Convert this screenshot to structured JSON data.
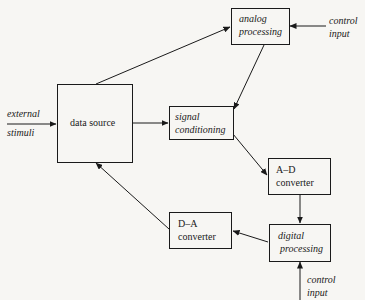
{
  "diagram": {
    "type": "block-diagram",
    "nodes": {
      "data_source": {
        "label": "data source"
      },
      "analog_processing": {
        "line1": "analog",
        "line2": "processing"
      },
      "signal_conditioning": {
        "line1": "signal",
        "line2": "conditioning"
      },
      "ad_converter": {
        "line1": "A–D",
        "line2": "converter"
      },
      "digital_processing": {
        "line1": "digital",
        "line2": "processing"
      },
      "da_converter": {
        "line1": "D–A",
        "line2": "converter"
      }
    },
    "external_inputs": {
      "stimuli": {
        "line1": "external",
        "line2": "stimuli"
      },
      "control_analog": {
        "line1": "control",
        "line2": "input"
      },
      "control_digital": {
        "line1": "control",
        "line2": "input"
      }
    },
    "edges": [
      {
        "from": "external stimuli",
        "to": "data source"
      },
      {
        "from": "data source",
        "to": "analog processing"
      },
      {
        "from": "data source",
        "to": "signal conditioning"
      },
      {
        "from": "control input",
        "to": "analog processing"
      },
      {
        "from": "analog processing",
        "to": "signal conditioning"
      },
      {
        "from": "signal conditioning",
        "to": "A–D converter"
      },
      {
        "from": "A–D converter",
        "to": "digital processing"
      },
      {
        "from": "control input",
        "to": "digital processing"
      },
      {
        "from": "digital processing",
        "to": "D–A converter"
      },
      {
        "from": "D–A converter",
        "to": "data source"
      }
    ],
    "colors": {
      "ink": "#1a1a1a",
      "paper": "#f7f6f3"
    }
  }
}
